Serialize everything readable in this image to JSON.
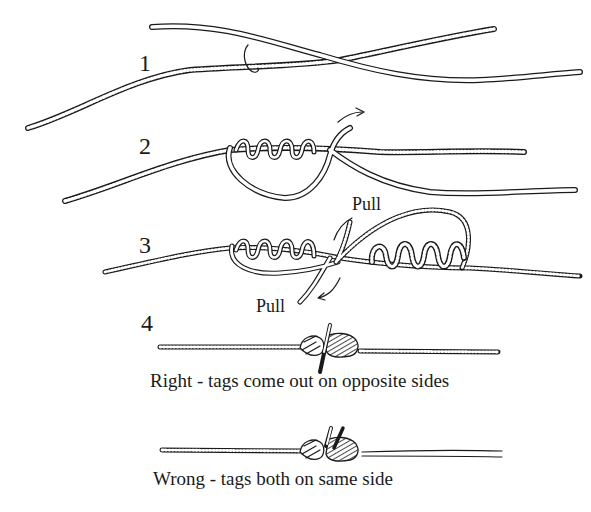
{
  "diagram": {
    "steps": [
      {
        "number": "1"
      },
      {
        "number": "2"
      },
      {
        "number": "3",
        "pull_top": "Pull",
        "pull_bottom": "Pull"
      },
      {
        "number": "4"
      }
    ],
    "captions": {
      "right": "Right - tags come out on opposite sides",
      "wrong": "Wrong - tags both on same side"
    },
    "colors": {
      "ink": "#1a1a1a",
      "background": "#ffffff"
    }
  }
}
